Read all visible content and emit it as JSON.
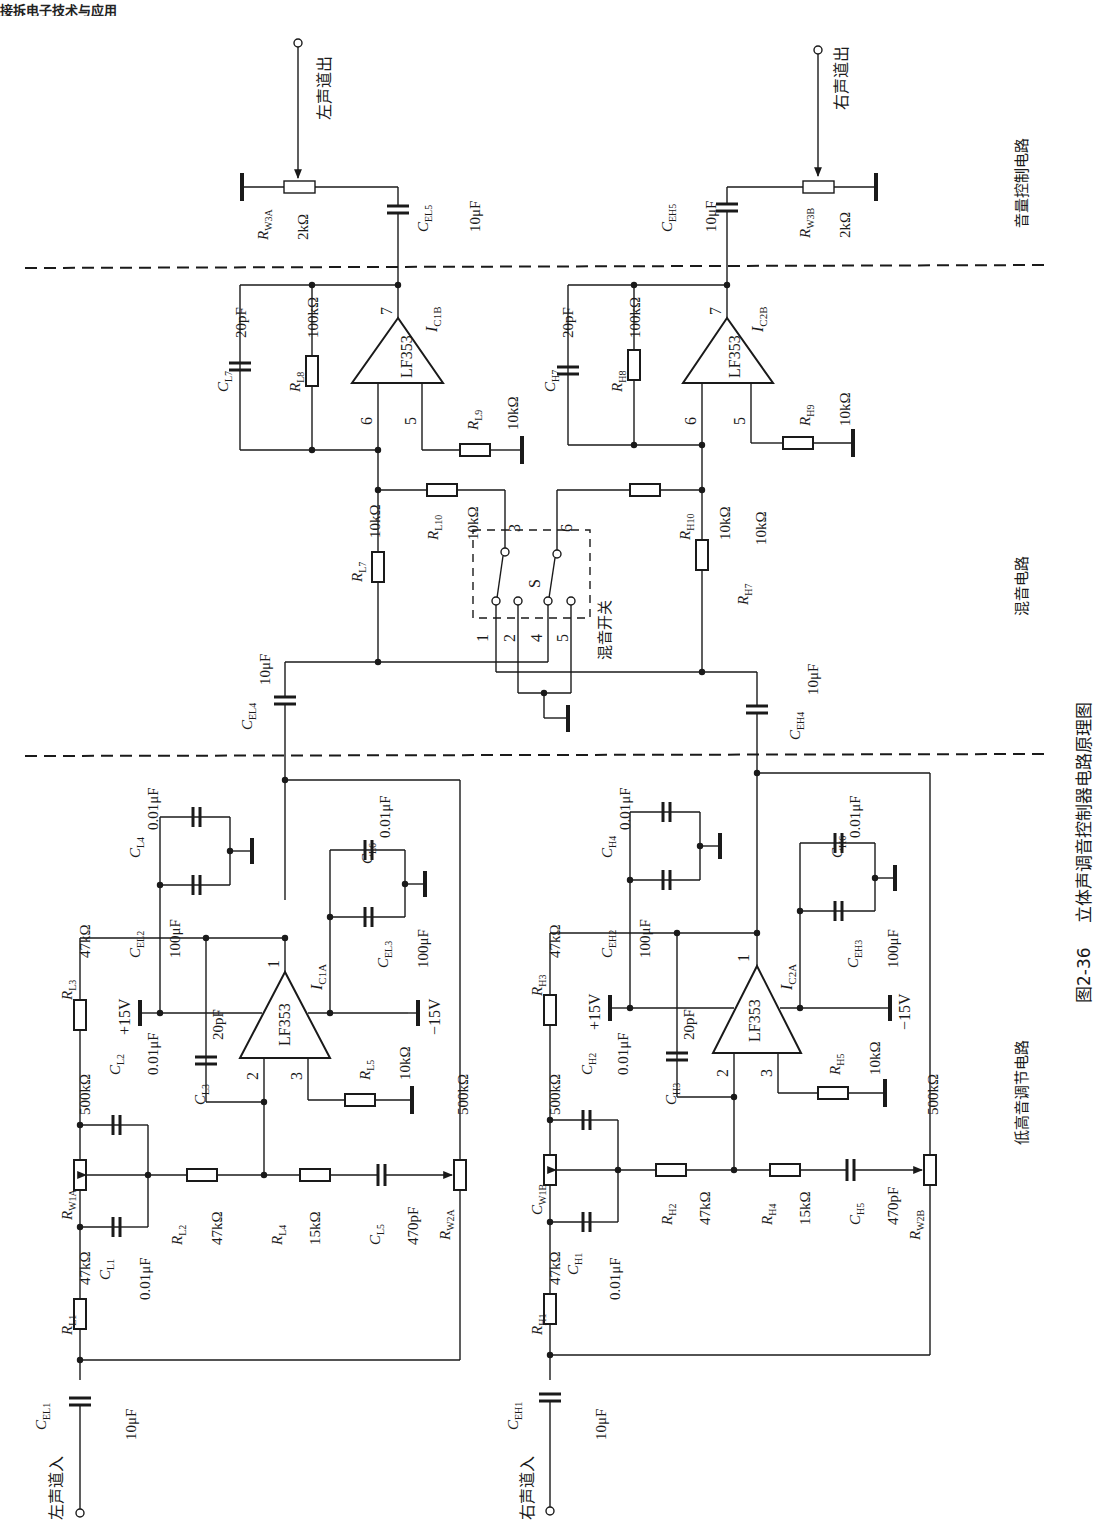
{
  "header_fragment": "接拆电子技术与应用",
  "figure": {
    "number": "图2-36",
    "title": "立体声调音控制器电路原理图"
  },
  "sections": {
    "volume": "音量控制电路",
    "mixing": "混音电路",
    "tone": "低高音调节电路"
  },
  "io": {
    "left_in": "左声道入",
    "right_in": "右声道入",
    "left_out": "左声道出",
    "right_out": "右声道出"
  },
  "switch": {
    "name": "S",
    "label": "混音开关",
    "pins": [
      "1",
      "2",
      "3",
      "4",
      "5",
      "6"
    ]
  },
  "opamps": [
    {
      "ref": "IC1B",
      "part": "LF353",
      "pins": {
        "inv": "6",
        "noninv": "5",
        "out": "7"
      }
    },
    {
      "ref": "IC2B",
      "part": "LF353",
      "pins": {
        "inv": "6",
        "noninv": "5",
        "out": "7"
      }
    },
    {
      "ref": "IC1A",
      "part": "LF353",
      "pins": {
        "inv": "2",
        "noninv": "3",
        "out": "1"
      }
    },
    {
      "ref": "IC2A",
      "part": "LF353",
      "pins": {
        "inv": "2",
        "noninv": "3",
        "out": "1"
      }
    }
  ],
  "supply": {
    "pos": "+15V",
    "neg": "−15V"
  },
  "components": {
    "RW3A": {
      "ref": "R",
      "sub": "W3A",
      "value": "2kΩ"
    },
    "RW3B": {
      "ref": "R",
      "sub": "W3B",
      "value": "2kΩ"
    },
    "CEL5": {
      "ref": "C",
      "sub": "EL5",
      "value": "10μF"
    },
    "CEH5": {
      "ref": "C",
      "sub": "EH5",
      "value": "10μF"
    },
    "CL7": {
      "ref": "C",
      "sub": "L7",
      "value": "20pF"
    },
    "CH7": {
      "ref": "C",
      "sub": "H7",
      "value": "20pF"
    },
    "RL8": {
      "ref": "R",
      "sub": "L8",
      "value": "100kΩ"
    },
    "RH8": {
      "ref": "R",
      "sub": "H8",
      "value": "100kΩ"
    },
    "RL9": {
      "ref": "R",
      "sub": "L9",
      "value": "10kΩ"
    },
    "RH9": {
      "ref": "R",
      "sub": "H9",
      "value": "10kΩ"
    },
    "RL7": {
      "ref": "R",
      "sub": "L7",
      "value": "10kΩ"
    },
    "RH7": {
      "ref": "R",
      "sub": "H7",
      "value": "10kΩ"
    },
    "RL10": {
      "ref": "R",
      "sub": "L10",
      "value": "10kΩ"
    },
    "RH10": {
      "ref": "R",
      "sub": "H10",
      "value": "10kΩ"
    },
    "CEL4": {
      "ref": "C",
      "sub": "EL4",
      "value": "10μF"
    },
    "CEH4": {
      "ref": "C",
      "sub": "EH4",
      "value": "10μF"
    },
    "CL4": {
      "ref": "C",
      "sub": "L4",
      "value": "0.01μF"
    },
    "CEL2": {
      "ref": "C",
      "sub": "EL2",
      "value": "100μF"
    },
    "CL6": {
      "ref": "C",
      "sub": "L6",
      "value": "0.01μF"
    },
    "CEL3": {
      "ref": "C",
      "sub": "EL3",
      "value": "100μF"
    },
    "CH4": {
      "ref": "C",
      "sub": "H4",
      "value": "0.01μF"
    },
    "CEH2": {
      "ref": "C",
      "sub": "EH2",
      "value": "100μF"
    },
    "CH6": {
      "ref": "C",
      "sub": "H6",
      "value": "0.01μF"
    },
    "CEH3": {
      "ref": "C",
      "sub": "EH3",
      "value": "100μF"
    },
    "RL3": {
      "ref": "R",
      "sub": "L3",
      "value": "47kΩ"
    },
    "RH3": {
      "ref": "R",
      "sub": "H3",
      "value": "47kΩ"
    },
    "CL3": {
      "ref": "C",
      "sub": "L3",
      "value": "20pF"
    },
    "CH3": {
      "ref": "C",
      "sub": "H3",
      "value": "20pF"
    },
    "RL5": {
      "ref": "R",
      "sub": "L5",
      "value": "10kΩ"
    },
    "RH5": {
      "ref": "R",
      "sub": "H5",
      "value": "10kΩ"
    },
    "CL2": {
      "ref": "C",
      "sub": "L2",
      "value": "0.01μF"
    },
    "CH2": {
      "ref": "C",
      "sub": "H2",
      "value": "0.01μF"
    },
    "RW1A": {
      "ref": "R",
      "sub": "W1A",
      "value": "500kΩ"
    },
    "CW1B": {
      "ref": "C",
      "sub": "W1B",
      "value": "500kΩ"
    },
    "CL1": {
      "ref": "C",
      "sub": "L1",
      "value": "0.01μF"
    },
    "CH1": {
      "ref": "C",
      "sub": "H1",
      "value": "0.01μF"
    },
    "RL1": {
      "ref": "R",
      "sub": "L1",
      "value": "47kΩ"
    },
    "RH1": {
      "ref": "R",
      "sub": "H1",
      "value": "47kΩ"
    },
    "RL2": {
      "ref": "R",
      "sub": "L2",
      "value": "47kΩ"
    },
    "RH2": {
      "ref": "R",
      "sub": "H2",
      "value": "47kΩ"
    },
    "RL4": {
      "ref": "R",
      "sub": "L4",
      "value": "15kΩ"
    },
    "RH4": {
      "ref": "R",
      "sub": "H4",
      "value": "15kΩ"
    },
    "CL5": {
      "ref": "C",
      "sub": "L5",
      "value": "470pF"
    },
    "CH5": {
      "ref": "C",
      "sub": "H5",
      "value": "470pF"
    },
    "RW2A": {
      "ref": "R",
      "sub": "W2A",
      "value": "500kΩ"
    },
    "RW2B": {
      "ref": "R",
      "sub": "W2B",
      "value": "500kΩ"
    },
    "CEL1": {
      "ref": "C",
      "sub": "EL1",
      "value": "10μF"
    },
    "CEH1": {
      "ref": "C",
      "sub": "EH1",
      "value": "10μF"
    }
  },
  "colors": {
    "ink": "#1a1a1a",
    "paper": "#ffffff"
  }
}
